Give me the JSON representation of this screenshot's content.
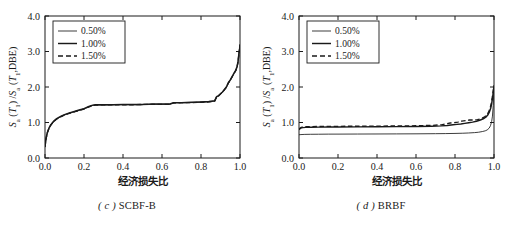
{
  "figure": {
    "panels": [
      {
        "id": "panel-c",
        "caption_index": "( c )",
        "caption_text": "SCBF-B",
        "chart_data": {
          "type": "line",
          "title": "(c) SCBF-B",
          "xlabel": "经济损失比",
          "ylabel": "S_a (T_1) / S_a (T_1, DBE)",
          "xlim": [
            0.0,
            1.0
          ],
          "ylim": [
            0.0,
            4.0
          ],
          "xticks": [
            "0.0",
            "0.2",
            "0.4",
            "0.6",
            "0.8",
            "1.0"
          ],
          "xtick_values": [
            0.0,
            0.2,
            0.4,
            0.6,
            0.8,
            1.0
          ],
          "yticks": [
            "0.0",
            "1.0",
            "2.0",
            "3.0",
            "4.0"
          ],
          "ytick_values": [
            0.0,
            1.0,
            2.0,
            3.0,
            4.0
          ],
          "grid": false,
          "legend_position": "upper-left",
          "series": [
            {
              "name": "0.50%",
              "style": "solid-thin",
              "x": [
                0.0,
                0.005,
                0.012,
                0.02,
                0.03,
                0.045,
                0.06,
                0.08,
                0.1,
                0.125,
                0.15,
                0.175,
                0.2,
                0.225,
                0.245,
                0.26,
                0.3,
                0.35,
                0.4,
                0.45,
                0.5,
                0.55,
                0.6,
                0.64,
                0.66,
                0.7,
                0.75,
                0.8,
                0.84,
                0.87,
                0.88,
                0.89,
                0.9,
                0.91,
                0.92,
                0.93,
                0.94,
                0.95,
                0.96,
                0.97,
                0.978,
                0.985,
                0.99,
                0.995,
                0.998,
                1.0
              ],
              "y": [
                0.3,
                0.52,
                0.7,
                0.82,
                0.92,
                1.02,
                1.09,
                1.16,
                1.21,
                1.26,
                1.3,
                1.34,
                1.38,
                1.44,
                1.48,
                1.49,
                1.49,
                1.5,
                1.5,
                1.5,
                1.5,
                1.51,
                1.51,
                1.51,
                1.55,
                1.55,
                1.56,
                1.57,
                1.58,
                1.6,
                1.72,
                1.74,
                1.8,
                1.85,
                1.92,
                1.98,
                2.1,
                2.18,
                2.28,
                2.38,
                2.45,
                2.55,
                2.7,
                2.95,
                3.05,
                3.18
              ]
            },
            {
              "name": "1.00%",
              "style": "solid-thick",
              "x": [
                0.0,
                0.005,
                0.012,
                0.02,
                0.03,
                0.045,
                0.06,
                0.08,
                0.1,
                0.125,
                0.15,
                0.175,
                0.2,
                0.225,
                0.245,
                0.26,
                0.3,
                0.35,
                0.4,
                0.45,
                0.5,
                0.55,
                0.6,
                0.64,
                0.66,
                0.7,
                0.75,
                0.8,
                0.84,
                0.87,
                0.88,
                0.89,
                0.9,
                0.91,
                0.92,
                0.93,
                0.94,
                0.95,
                0.96,
                0.97,
                0.978,
                0.985,
                0.99,
                0.995,
                0.998,
                1.0
              ],
              "y": [
                0.32,
                0.55,
                0.72,
                0.84,
                0.94,
                1.04,
                1.11,
                1.17,
                1.22,
                1.27,
                1.31,
                1.35,
                1.39,
                1.45,
                1.49,
                1.5,
                1.5,
                1.5,
                1.51,
                1.51,
                1.51,
                1.52,
                1.52,
                1.52,
                1.56,
                1.56,
                1.57,
                1.58,
                1.59,
                1.61,
                1.73,
                1.76,
                1.81,
                1.86,
                1.93,
                2.0,
                2.12,
                2.2,
                2.3,
                2.4,
                2.47,
                2.58,
                2.72,
                2.98,
                3.08,
                3.2
              ]
            },
            {
              "name": "1.50%",
              "style": "dashed",
              "x": [
                0.0,
                0.005,
                0.012,
                0.02,
                0.03,
                0.045,
                0.06,
                0.08,
                0.1,
                0.125,
                0.15,
                0.175,
                0.2,
                0.225,
                0.245,
                0.26,
                0.3,
                0.35,
                0.4,
                0.45,
                0.5,
                0.55,
                0.6,
                0.64,
                0.66,
                0.7,
                0.75,
                0.8,
                0.84,
                0.87,
                0.88,
                0.89,
                0.9,
                0.91,
                0.92,
                0.93,
                0.94,
                0.95,
                0.96,
                0.97,
                0.978,
                0.985,
                0.99,
                0.995,
                0.998,
                1.0
              ],
              "y": [
                0.31,
                0.53,
                0.71,
                0.83,
                0.93,
                1.03,
                1.1,
                1.16,
                1.21,
                1.26,
                1.3,
                1.34,
                1.38,
                1.44,
                1.48,
                1.49,
                1.5,
                1.5,
                1.5,
                1.5,
                1.51,
                1.51,
                1.51,
                1.51,
                1.55,
                1.56,
                1.56,
                1.57,
                1.58,
                1.6,
                1.72,
                1.75,
                1.8,
                1.85,
                1.92,
                1.99,
                2.11,
                2.19,
                2.29,
                2.39,
                2.46,
                2.56,
                2.71,
                2.96,
                3.06,
                3.19
              ]
            }
          ]
        },
        "legend": [
          {
            "label": "0.50%",
            "style": "solid-thin"
          },
          {
            "label": "1.00%",
            "style": "solid-thick"
          },
          {
            "label": "1.50%",
            "style": "dashed"
          }
        ]
      },
      {
        "id": "panel-d",
        "caption_index": "( d )",
        "caption_text": "BRBF",
        "chart_data": {
          "type": "line",
          "title": "(d) BRBF",
          "xlabel": "经济损失比",
          "ylabel": "S_a (T_1) / S_a (T_1, DBE)",
          "xlim": [
            0.0,
            1.0
          ],
          "ylim": [
            0.0,
            4.0
          ],
          "xticks": [
            "0.0",
            "0.2",
            "0.4",
            "0.6",
            "0.8",
            "1.0"
          ],
          "xtick_values": [
            0.0,
            0.2,
            0.4,
            0.6,
            0.8,
            1.0
          ],
          "yticks": [
            "0.0",
            "1.0",
            "2.0",
            "3.0",
            "4.0"
          ],
          "ytick_values": [
            0.0,
            1.0,
            2.0,
            3.0,
            4.0
          ],
          "grid": false,
          "legend_position": "upper-left",
          "series": [
            {
              "name": "0.50%",
              "style": "solid-thin",
              "x": [
                0.0,
                0.01,
                0.03,
                0.06,
                0.1,
                0.15,
                0.2,
                0.3,
                0.4,
                0.5,
                0.6,
                0.7,
                0.75,
                0.8,
                0.84,
                0.87,
                0.9,
                0.92,
                0.94,
                0.955,
                0.965,
                0.975,
                0.982,
                0.988,
                0.992,
                0.996,
                0.999,
                1.0
              ],
              "y": [
                0.655,
                0.66,
                0.665,
                0.668,
                0.67,
                0.672,
                0.673,
                0.675,
                0.677,
                0.679,
                0.681,
                0.685,
                0.688,
                0.692,
                0.698,
                0.705,
                0.715,
                0.725,
                0.745,
                0.765,
                0.79,
                0.84,
                0.91,
                1.03,
                1.18,
                1.48,
                1.88,
                2.0
              ]
            },
            {
              "name": "1.00%",
              "style": "solid-thick",
              "x": [
                0.0,
                0.006,
                0.012,
                0.02,
                0.035,
                0.06,
                0.1,
                0.15,
                0.2,
                0.3,
                0.4,
                0.5,
                0.6,
                0.68,
                0.73,
                0.76,
                0.79,
                0.81,
                0.83,
                0.85,
                0.87,
                0.89,
                0.91,
                0.93,
                0.945,
                0.958,
                0.968,
                0.976,
                0.983,
                0.988,
                0.992,
                0.996,
                0.999,
                1.0
              ],
              "y": [
                0.8,
                0.83,
                0.848,
                0.856,
                0.862,
                0.866,
                0.87,
                0.872,
                0.874,
                0.877,
                0.88,
                0.883,
                0.888,
                0.895,
                0.905,
                0.918,
                0.935,
                0.948,
                0.96,
                0.975,
                0.992,
                1.01,
                1.035,
                1.07,
                1.105,
                1.15,
                1.21,
                1.29,
                1.4,
                1.53,
                1.68,
                1.84,
                1.98,
                2.05
              ]
            },
            {
              "name": "1.50%",
              "style": "dashed",
              "x": [
                0.0,
                0.006,
                0.012,
                0.02,
                0.035,
                0.06,
                0.1,
                0.15,
                0.2,
                0.3,
                0.4,
                0.5,
                0.6,
                0.68,
                0.73,
                0.755,
                0.775,
                0.795,
                0.815,
                0.835,
                0.855,
                0.875,
                0.895,
                0.915,
                0.935,
                0.95,
                0.962,
                0.972,
                0.98,
                0.986,
                0.991,
                0.995,
                0.999,
                1.0
              ],
              "y": [
                0.81,
                0.845,
                0.865,
                0.875,
                0.88,
                0.884,
                0.888,
                0.89,
                0.892,
                0.895,
                0.898,
                0.902,
                0.908,
                0.918,
                0.935,
                0.965,
                0.985,
                0.998,
                1.01,
                1.04,
                1.055,
                1.07,
                1.07,
                1.08,
                1.11,
                1.15,
                1.21,
                1.29,
                1.4,
                1.54,
                1.7,
                1.86,
                1.985,
                2.03
              ]
            }
          ]
        },
        "legend": [
          {
            "label": "0.50%",
            "style": "solid-thin"
          },
          {
            "label": "1.00%",
            "style": "solid-thick"
          },
          {
            "label": "1.50%",
            "style": "dashed"
          }
        ]
      }
    ],
    "ylabel_parts": {
      "s1": "S",
      "sub1": "a",
      "open1": " (",
      "t1": "T",
      "tsub1": "1",
      "close1": ") /",
      "s2": "S",
      "sub2": "a",
      "open2": " (",
      "t2": "T",
      "tsub2": "1",
      "comma": ",DBE)"
    },
    "xlabel": "经济损失比"
  }
}
